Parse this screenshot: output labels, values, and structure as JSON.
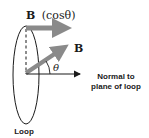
{
  "diagram": {
    "labels": {
      "b_component": "B",
      "b_component_expr": "(cosθ)",
      "b_vector": "B",
      "angle": "θ",
      "normal_line1": "Normal to",
      "normal_line2": "plane of loop",
      "loop": "Loop"
    },
    "colors": {
      "vector_gray": "#8a8a8a",
      "line_black": "#1a1a1a",
      "background": "#ffffff"
    }
  }
}
